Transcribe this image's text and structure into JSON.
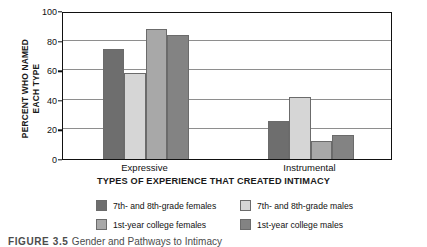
{
  "chart_data": {
    "type": "bar",
    "title": "",
    "xlabel": "TYPES OF EXPERIENCE THAT CREATED INTIMACY",
    "ylabel": "PERCENT WHO NAMED EACH TYPE",
    "ylabel_line1": "PERCENT WHO NAMED",
    "ylabel_line2": "EACH TYPE",
    "categories": [
      "Expressive",
      "Instrumental"
    ],
    "ylim": [
      0,
      100
    ],
    "yticks": [
      0,
      20,
      40,
      60,
      80,
      100
    ],
    "ytick_labels": [
      "0",
      "20",
      "40",
      "60",
      "80",
      "100"
    ],
    "grid": true,
    "legend_position": "bottom",
    "series": [
      {
        "name": "7th- and 8th-grade females",
        "color": "#6e6e6e",
        "values": [
          74,
          26
        ]
      },
      {
        "name": "7th- and 8th-grade males",
        "color": "#d6d6d6",
        "values": [
          58,
          42
        ]
      },
      {
        "name": "1st-year college females",
        "color": "#a8a8a8",
        "values": [
          88,
          12
        ]
      },
      {
        "name": "1st-year college males",
        "color": "#838383",
        "values": [
          84,
          16
        ]
      }
    ]
  },
  "caption": {
    "figure_number": "FIGURE  3.5",
    "text": "Gender and Pathways to Intimacy"
  },
  "colors": {
    "axis": "#111111",
    "gridline": "#8e8e8e",
    "bar_outline": "#6b6b6b",
    "background": "#ffffff"
  }
}
